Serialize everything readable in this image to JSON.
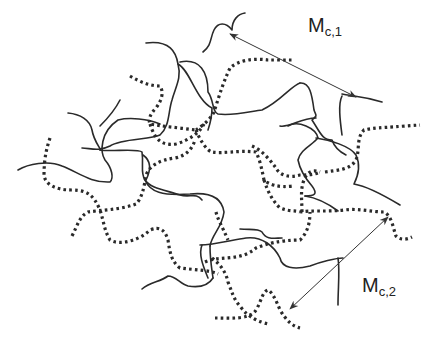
{
  "diagram": {
    "type": "polymer network schematic",
    "legend": {
      "solid_line": "network chain (type 1)",
      "dotted_line": "network chain (type 2)"
    },
    "labels": [
      {
        "id": "mc1",
        "main": "M",
        "subscript": "c,1",
        "position": [
          308,
          15
        ]
      },
      {
        "id": "mc2",
        "main": "M",
        "subscript": "c,2",
        "position": [
          362,
          275
        ]
      }
    ],
    "arrows": [
      {
        "id": "arrow-mc1",
        "from": [
          230,
          34
        ],
        "to": [
          356,
          97
        ],
        "double_headed": true
      },
      {
        "id": "arrow-mc2",
        "from": [
          388,
          217
        ],
        "to": [
          290,
          309
        ],
        "double_headed": true
      }
    ],
    "colors": {
      "line": "#2a2a2a",
      "text": "#222222",
      "background": "#ffffff"
    }
  }
}
